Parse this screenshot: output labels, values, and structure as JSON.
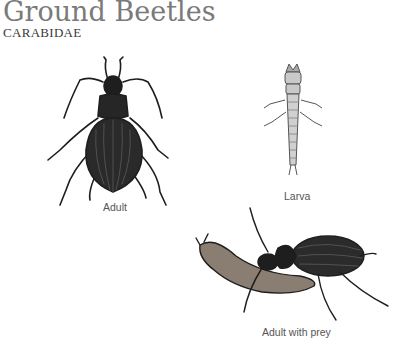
{
  "header": {
    "title": "Ground Beetles",
    "subtitle": "CARABIDAE"
  },
  "figures": [
    {
      "id": "adult",
      "caption": "Adult"
    },
    {
      "id": "larva",
      "caption": "Larva"
    },
    {
      "id": "adult-with-prey",
      "caption": "Adult with prey"
    }
  ],
  "colors": {
    "title": "#7a7a7a",
    "subtitle": "#3a3a3a",
    "caption": "#555555",
    "ink": "#1e1e1e"
  }
}
